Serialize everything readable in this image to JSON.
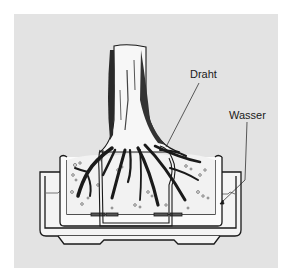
{
  "figure": {
    "background_color": "#e3e3e3",
    "line_color": "#1a1a1a",
    "labels": {
      "wire": "Draht",
      "water": "Wasser"
    }
  }
}
